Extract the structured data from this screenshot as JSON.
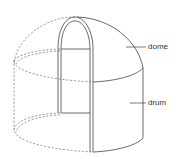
{
  "diagram": {
    "labels": [
      {
        "id": "dome",
        "text": "dome"
      },
      {
        "id": "drum",
        "text": "drum"
      }
    ],
    "colors": {
      "line": "#444444",
      "hidden_line": "#777777",
      "background": "#ffffff"
    }
  }
}
